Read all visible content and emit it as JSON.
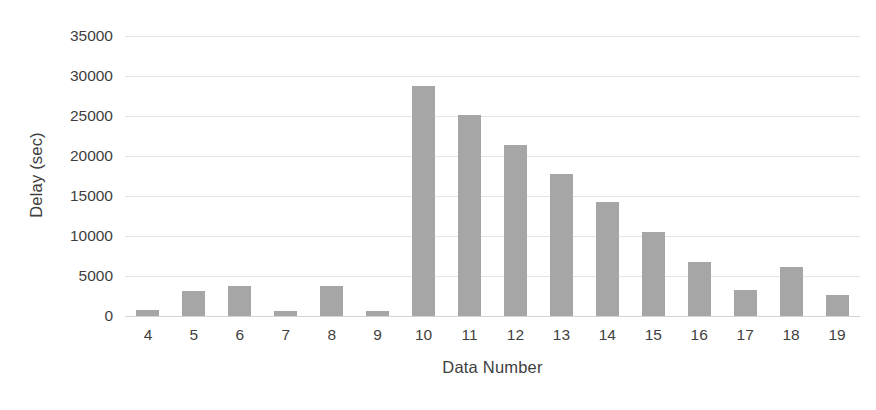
{
  "chart_data": {
    "type": "bar",
    "title": "",
    "xlabel": "Data Number",
    "ylabel": "Delay (sec)",
    "categories": [
      "4",
      "5",
      "6",
      "7",
      "8",
      "9",
      "10",
      "11",
      "12",
      "13",
      "14",
      "15",
      "16",
      "17",
      "18",
      "19"
    ],
    "values": [
      700,
      3100,
      3700,
      600,
      3800,
      600,
      28750,
      25100,
      21400,
      17800,
      14200,
      10500,
      6800,
      3300,
      6100,
      2600
    ],
    "series": [
      {
        "name": "Delay",
        "values": [
          700,
          3100,
          3700,
          600,
          3800,
          600,
          28750,
          25100,
          21400,
          17800,
          14200,
          10500,
          6800,
          3300,
          6100,
          2600
        ]
      }
    ],
    "ylim": [
      0,
      35000
    ],
    "yticks": [
      0,
      5000,
      10000,
      15000,
      20000,
      25000,
      30000,
      35000
    ],
    "ytick_labels": [
      "0",
      "5000",
      "10000",
      "15000",
      "20000",
      "25000",
      "30000",
      "35000"
    ],
    "grid": true,
    "legend": "none",
    "bar_color": "#a6a6a6",
    "grid_color": "#e4e4e4",
    "axis_color": "#d3d3d3",
    "text_color": "#3f3f3f"
  }
}
